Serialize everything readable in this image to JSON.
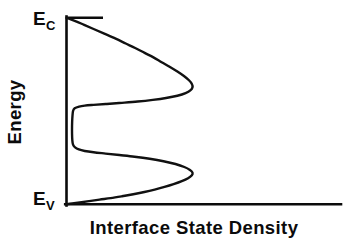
{
  "figure": {
    "background_color": "#ffffff",
    "ink_color": "#0b0b0b",
    "width": 344,
    "height": 243
  },
  "chart_data": {
    "type": "line",
    "title": "",
    "subtitle": "",
    "xlabel": "Interface State Density",
    "ylabel": "Energy",
    "orientation": "horizontal-density-vs-vertical-energy",
    "grid": false,
    "legend": false,
    "legend_position": "none",
    "xlim": [
      0,
      1
    ],
    "ylim": [
      0,
      1
    ],
    "xticks": [],
    "xticklabels": [],
    "yticks": [
      0,
      1
    ],
    "yticklabels": [
      "E_V",
      "E_C"
    ],
    "y_tick_labels_rendered": [
      {
        "base": "E",
        "sub": "C",
        "position": "top",
        "value": 1
      },
      {
        "base": "E",
        "sub": "V",
        "position": "bottom",
        "value": 0
      }
    ],
    "series": [
      {
        "name": "Interface State Density",
        "color": "#111111",
        "linewidth": 2.4,
        "x_is_density": true,
        "points": [
          {
            "energy": 1.0,
            "density": 0.0
          },
          {
            "energy": 0.993,
            "density": 0.03
          },
          {
            "energy": 0.98,
            "density": 0.08
          },
          {
            "energy": 0.962,
            "density": 0.14
          },
          {
            "energy": 0.94,
            "density": 0.215
          },
          {
            "energy": 0.915,
            "density": 0.3
          },
          {
            "energy": 0.888,
            "density": 0.39
          },
          {
            "energy": 0.862,
            "density": 0.47
          },
          {
            "energy": 0.838,
            "density": 0.545
          },
          {
            "energy": 0.812,
            "density": 0.62
          },
          {
            "energy": 0.788,
            "density": 0.69
          },
          {
            "energy": 0.762,
            "density": 0.755
          },
          {
            "energy": 0.738,
            "density": 0.818
          },
          {
            "energy": 0.712,
            "density": 0.88
          },
          {
            "energy": 0.688,
            "density": 0.932
          },
          {
            "energy": 0.665,
            "density": 0.972
          },
          {
            "energy": 0.645,
            "density": 0.995
          },
          {
            "energy": 0.628,
            "density": 1.0
          },
          {
            "energy": 0.612,
            "density": 0.985
          },
          {
            "energy": 0.596,
            "density": 0.945
          },
          {
            "energy": 0.582,
            "density": 0.88
          },
          {
            "energy": 0.57,
            "density": 0.79
          },
          {
            "energy": 0.56,
            "density": 0.685
          },
          {
            "energy": 0.551,
            "density": 0.565
          },
          {
            "energy": 0.544,
            "density": 0.44
          },
          {
            "energy": 0.538,
            "density": 0.32
          },
          {
            "energy": 0.533,
            "density": 0.215
          },
          {
            "energy": 0.529,
            "density": 0.145
          },
          {
            "energy": 0.524,
            "density": 0.1
          },
          {
            "energy": 0.515,
            "density": 0.065
          },
          {
            "energy": 0.5,
            "density": 0.052
          },
          {
            "energy": 0.46,
            "density": 0.046
          },
          {
            "energy": 0.42,
            "density": 0.044
          },
          {
            "energy": 0.38,
            "density": 0.044
          },
          {
            "energy": 0.345,
            "density": 0.046
          },
          {
            "energy": 0.32,
            "density": 0.052
          },
          {
            "energy": 0.305,
            "density": 0.068
          },
          {
            "energy": 0.294,
            "density": 0.098
          },
          {
            "energy": 0.286,
            "density": 0.145
          },
          {
            "energy": 0.279,
            "density": 0.215
          },
          {
            "energy": 0.272,
            "density": 0.31
          },
          {
            "energy": 0.264,
            "density": 0.42
          },
          {
            "energy": 0.255,
            "density": 0.54
          },
          {
            "energy": 0.244,
            "density": 0.66
          },
          {
            "energy": 0.231,
            "density": 0.77
          },
          {
            "energy": 0.216,
            "density": 0.865
          },
          {
            "energy": 0.2,
            "density": 0.935
          },
          {
            "energy": 0.184,
            "density": 0.98
          },
          {
            "energy": 0.17,
            "density": 1.0
          },
          {
            "energy": 0.156,
            "density": 0.995
          },
          {
            "energy": 0.14,
            "density": 0.965
          },
          {
            "energy": 0.124,
            "density": 0.915
          },
          {
            "energy": 0.108,
            "density": 0.85
          },
          {
            "energy": 0.093,
            "density": 0.778
          },
          {
            "energy": 0.079,
            "density": 0.7
          },
          {
            "energy": 0.066,
            "density": 0.618
          },
          {
            "energy": 0.054,
            "density": 0.53
          },
          {
            "energy": 0.043,
            "density": 0.44
          },
          {
            "energy": 0.033,
            "density": 0.35
          },
          {
            "energy": 0.025,
            "density": 0.262
          },
          {
            "energy": 0.017,
            "density": 0.18
          },
          {
            "energy": 0.01,
            "density": 0.105
          },
          {
            "energy": 0.004,
            "density": 0.045
          },
          {
            "energy": 0.0,
            "density": 0.0
          }
        ],
        "peaks": [
          {
            "label": "upper-peak-near-conduction-band",
            "energy": 0.628,
            "density": 1.0
          },
          {
            "label": "lower-peak-near-valence-band",
            "energy": 0.17,
            "density": 1.0
          }
        ],
        "midgap_minimum": {
          "energy": 0.4,
          "density": 0.044
        }
      }
    ]
  },
  "labels": {
    "y_axis_title": "Energy",
    "x_axis_title": "Interface State Density",
    "e_c_base": "E",
    "e_c_sub": "C",
    "e_v_base": "E",
    "e_v_sub": "V"
  }
}
